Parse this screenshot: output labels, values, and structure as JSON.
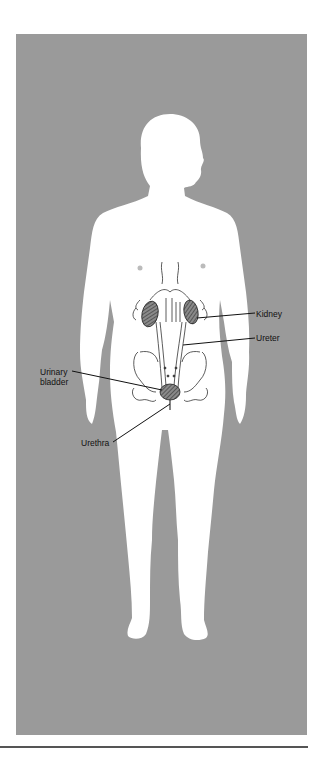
{
  "diagram": {
    "colors": {
      "background": "#9a9a9a",
      "silhouette": "#ffffff",
      "outline": "#333333",
      "organ_fill": "#6e6e6e",
      "leader_line": "#111111",
      "rule": "#555555"
    },
    "labels": {
      "kidney": "Kidney",
      "ureter": "Ureter",
      "urinary_bladder_line1": "Urinary",
      "urinary_bladder_line2": "bladder",
      "urethra": "Urethra"
    }
  }
}
